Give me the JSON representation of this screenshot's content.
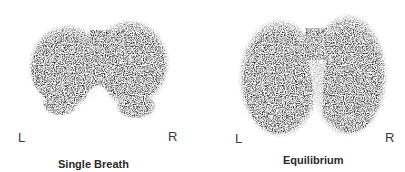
{
  "figure": {
    "panels": [
      {
        "id": "single-breath",
        "caption": "Single Breath",
        "left_label": "L",
        "right_label": "R"
      },
      {
        "id": "equilibrium",
        "caption": "Equilibrium",
        "left_label": "L",
        "right_label": "R"
      }
    ],
    "colors": {
      "background": "#ffffff",
      "scan_dark": "#1e1e1e",
      "label_text": "#3a3a3a"
    }
  }
}
